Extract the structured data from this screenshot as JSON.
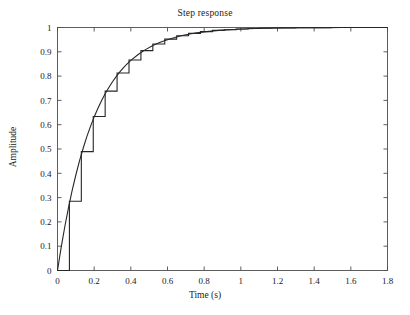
{
  "chart_data": {
    "type": "line",
    "title": "Step response",
    "xlabel": "Time (s)",
    "ylabel": "Amplitude",
    "xlim": [
      0,
      1.8
    ],
    "ylim": [
      0,
      1
    ],
    "grid": false,
    "legend": null,
    "xticks": [
      "0",
      "0.2",
      "0.4",
      "0.6",
      "0.8",
      "1",
      "1.2",
      "1.4",
      "1.6",
      "1.8"
    ],
    "xtick_values": [
      0,
      0.2,
      0.4,
      0.6,
      0.8,
      1.0,
      1.2,
      1.4,
      1.6,
      1.8
    ],
    "yticks": [
      "0",
      "0.1",
      "0.2",
      "0.3",
      "0.4",
      "0.5",
      "0.6",
      "0.7",
      "0.8",
      "0.9",
      "1"
    ],
    "ytick_values": [
      0,
      0.1,
      0.2,
      0.3,
      0.4,
      0.5,
      0.6,
      0.7,
      0.8,
      0.9,
      1.0
    ],
    "series": [
      {
        "name": "continuous-step-response",
        "style": "smooth-curve",
        "color": "#262626",
        "x": [
          0,
          0.02,
          0.04,
          0.06,
          0.08,
          0.1,
          0.12,
          0.14,
          0.16,
          0.18,
          0.2,
          0.22,
          0.24,
          0.26,
          0.28,
          0.3,
          0.32,
          0.34,
          0.36,
          0.38,
          0.4,
          0.44,
          0.48,
          0.52,
          0.56,
          0.6,
          0.64,
          0.68,
          0.72,
          0.76,
          0.8,
          0.88,
          0.96,
          1.04,
          1.12,
          1.2,
          1.32,
          1.44,
          1.56,
          1.68,
          1.8
        ],
        "values": [
          0,
          0.095,
          0.181,
          0.259,
          0.33,
          0.393,
          0.451,
          0.503,
          0.551,
          0.593,
          0.632,
          0.667,
          0.699,
          0.727,
          0.753,
          0.777,
          0.798,
          0.817,
          0.835,
          0.85,
          0.865,
          0.889,
          0.909,
          0.926,
          0.939,
          0.95,
          0.959,
          0.967,
          0.973,
          0.978,
          0.982,
          0.988,
          0.992,
          0.995,
          0.997,
          0.998,
          0.999,
          0.999,
          1.0,
          1.0,
          1.0
        ]
      },
      {
        "name": "discrete-zero-order-hold",
        "style": "staircase",
        "color": "#262626",
        "sample_period": 0.065,
        "x": [
          0,
          0.065,
          0.13,
          0.195,
          0.26,
          0.325,
          0.39,
          0.455,
          0.52,
          0.585,
          0.65,
          0.715,
          0.78,
          0.845,
          0.91,
          0.975,
          1.04,
          1.105,
          1.17,
          1.235,
          1.3,
          1.365,
          1.43,
          1.495,
          1.56,
          1.625,
          1.69,
          1.755,
          1.8
        ],
        "values": [
          0,
          0.285,
          0.489,
          0.634,
          0.738,
          0.813,
          0.866,
          0.905,
          0.932,
          0.952,
          0.966,
          0.976,
          0.983,
          0.988,
          0.991,
          0.994,
          0.996,
          0.997,
          0.998,
          0.998,
          0.999,
          0.999,
          0.999,
          1.0,
          1.0,
          1.0,
          1.0,
          1.0,
          1.0
        ]
      }
    ]
  },
  "chart": {
    "title": "Step response",
    "xlabel": "Time (s)",
    "ylabel": "Amplitude"
  }
}
